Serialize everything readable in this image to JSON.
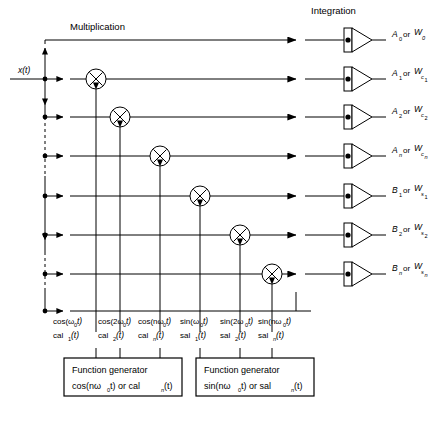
{
  "figure": {
    "headers": {
      "multiplication": "Multiplication",
      "integration": "Integration"
    },
    "input_label": "x(t)",
    "icons": {
      "multiplier": "multiply-circle-icon",
      "integrator": "integrator-triangle-icon",
      "arrow": "arrowhead-icon",
      "junction": "junction-dot-icon"
    }
  },
  "outputs": [
    {
      "main": "A",
      "main_sub": "0",
      "or": "or",
      "alt": "W",
      "alt_sub": "0",
      "alt_sub2": ""
    },
    {
      "main": "A",
      "main_sub": "1",
      "or": "or",
      "alt": "W",
      "alt_sub": "c",
      "alt_sub2": "1"
    },
    {
      "main": "A",
      "main_sub": "2",
      "or": "or",
      "alt": "W",
      "alt_sub": "c",
      "alt_sub2": "2"
    },
    {
      "main": "A",
      "main_sub": "n",
      "or": "or",
      "alt": "W",
      "alt_sub": "c",
      "alt_sub2": "n"
    },
    {
      "main": "B",
      "main_sub": "1",
      "or": "or",
      "alt": "W",
      "alt_sub": "s",
      "alt_sub2": "1"
    },
    {
      "main": "B",
      "main_sub": "2",
      "or": "or",
      "alt": "W",
      "alt_sub": "s",
      "alt_sub2": "2"
    },
    {
      "main": "B",
      "main_sub": "n",
      "or": "or",
      "alt": "W",
      "alt_sub": "s",
      "alt_sub2": "n"
    }
  ],
  "carrier_labels": [
    {
      "trig": "cos(ω",
      "trig_sub": "0",
      "trig_tail": "t)",
      "walsh": "cal",
      "walsh_sub": "1",
      "walsh_tail": "(t)"
    },
    {
      "trig": "cos(2ω",
      "trig_sub": "0",
      "trig_tail": "t)",
      "walsh": "cal",
      "walsh_sub": "2",
      "walsh_tail": "(t)"
    },
    {
      "trig": "cos(nω",
      "trig_sub": "0",
      "trig_tail": "t)",
      "walsh": "cal",
      "walsh_sub": "n",
      "walsh_tail": "(t)"
    },
    {
      "trig": "sin(ω",
      "trig_sub": "0",
      "trig_tail": "t)",
      "walsh": "sal",
      "walsh_sub": "1",
      "walsh_tail": "(t)"
    },
    {
      "trig": "sin(2ω",
      "trig_sub": "0",
      "trig_tail": "t)",
      "walsh": "sal",
      "walsh_sub": "2",
      "walsh_tail": "(t)"
    },
    {
      "trig": "sin(nω",
      "trig_sub": "0",
      "trig_tail": "t)",
      "walsh": "sal",
      "walsh_sub": "n",
      "walsh_tail": "(t)"
    }
  ],
  "generators": [
    {
      "line1": "Function generator",
      "line2_a": "cos(nω",
      "line2_sub": "0",
      "line2_b": "t) or cal",
      "line2_sub2": "n",
      "line2_c": "(t)"
    },
    {
      "line1": "Function generator",
      "line2_a": "sin(nω",
      "line2_sub": "0",
      "line2_b": "t) or sal",
      "line2_sub2": "n",
      "line2_c": "(t)"
    }
  ],
  "colors": {
    "ink": "#000000",
    "paper": "#ffffff"
  }
}
